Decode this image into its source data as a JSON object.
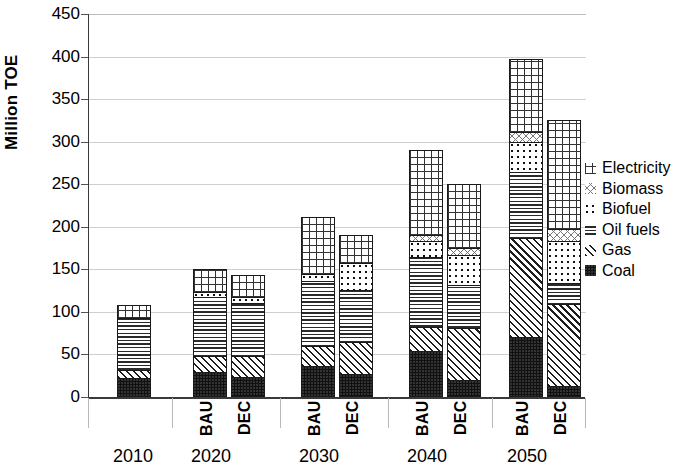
{
  "chart_data": {
    "type": "bar",
    "stacked": true,
    "title": "",
    "xlabel": "",
    "ylabel": "Million TOE",
    "ylim": [
      0,
      450
    ],
    "ytick_step": 50,
    "yticks": [
      "0",
      "50",
      "100",
      "150",
      "200",
      "250",
      "300",
      "350",
      "400",
      "450"
    ],
    "grid": true,
    "legend_position": "right",
    "groups": [
      {
        "year": "2010",
        "scenarios": [
          "",
          ""
        ]
      },
      {
        "year": "2020",
        "scenarios": [
          "BAU",
          "DEC"
        ]
      },
      {
        "year": "2030",
        "scenarios": [
          "BAU",
          "DEC"
        ]
      },
      {
        "year": "2040",
        "scenarios": [
          "BAU",
          "DEC"
        ]
      },
      {
        "year": "2050",
        "scenarios": [
          "BAU",
          "DEC"
        ]
      }
    ],
    "categories": [
      "2010",
      "2020 BAU",
      "2020 DEC",
      "2030 BAU",
      "2030 DEC",
      "2040 BAU",
      "2040 DEC",
      "2050 BAU",
      "2050 DEC"
    ],
    "series": [
      {
        "name": "Coal",
        "pattern": "solid-black",
        "values": [
          21,
          28,
          21,
          35,
          25,
          52,
          18,
          68,
          11
        ]
      },
      {
        "name": "Gas",
        "pattern": "diagonal-hatch",
        "values": [
          9,
          19,
          26,
          23,
          38,
          28,
          62,
          117,
          97
        ]
      },
      {
        "name": "Oil fuels",
        "pattern": "horizontal-lines",
        "values": [
          62,
          70,
          63,
          77,
          62,
          83,
          51,
          78,
          24
        ]
      },
      {
        "name": "Biofuel",
        "pattern": "dots",
        "values": [
          0,
          6,
          7,
          9,
          32,
          19,
          35,
          36,
          50
        ]
      },
      {
        "name": "Biomass",
        "pattern": "sparse-cross",
        "values": [
          0,
          0,
          0,
          0,
          0,
          7,
          8,
          12,
          15
        ]
      },
      {
        "name": "Electricity",
        "pattern": "cross-hatch",
        "values": [
          16,
          27,
          26,
          67,
          33,
          101,
          76,
          86,
          129
        ]
      }
    ],
    "totals": [
      108,
      150,
      143,
      211,
      190,
      290,
      250,
      397,
      326
    ],
    "legend": [
      {
        "label": "Electricity",
        "pattern": "cross-hatch"
      },
      {
        "label": "Biomass",
        "pattern": "sparse-cross"
      },
      {
        "label": "Biofuel",
        "pattern": "dots"
      },
      {
        "label": "Oil fuels",
        "pattern": "horizontal-lines"
      },
      {
        "label": "Gas",
        "pattern": "diagonal-hatch"
      },
      {
        "label": "Coal",
        "pattern": "solid-black"
      }
    ]
  }
}
